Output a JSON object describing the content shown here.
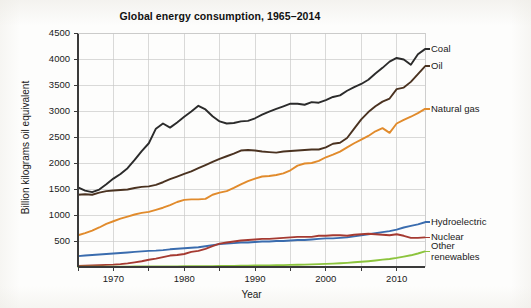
{
  "chart_data": {
    "type": "line",
    "title": "Global energy consumption, 1965–2014",
    "xlabel": "Year",
    "ylabel": "Billion kilograms oil equivalent",
    "xlim": [
      1965,
      2014
    ],
    "ylim": [
      0,
      4500
    ],
    "xticks": [
      1970,
      1980,
      1990,
      2000,
      2010
    ],
    "xticklabels": [
      "1970",
      "1980",
      "1990",
      "2000",
      "2010"
    ],
    "xminorticks": [
      1965,
      1975,
      1985,
      1995,
      2005
    ],
    "yticks": [
      500,
      1000,
      1500,
      2000,
      2500,
      3000,
      3500,
      4000,
      4500
    ],
    "yticklabels": [
      "500",
      "1000",
      "1500",
      "2000",
      "2500",
      "3000",
      "3500",
      "4000",
      "4500"
    ],
    "grid": true,
    "legend_position": "right-inline-labels",
    "x": [
      1965,
      1966,
      1967,
      1968,
      1969,
      1970,
      1971,
      1972,
      1973,
      1974,
      1975,
      1976,
      1977,
      1978,
      1979,
      1980,
      1981,
      1982,
      1983,
      1984,
      1985,
      1986,
      1987,
      1988,
      1989,
      1990,
      1991,
      1992,
      1993,
      1994,
      1995,
      1996,
      1997,
      1998,
      1999,
      2000,
      2001,
      2002,
      2003,
      2004,
      2005,
      2006,
      2007,
      2008,
      2009,
      2010,
      2011,
      2012,
      2013,
      2014
    ],
    "series": [
      {
        "name": "Coal",
        "color": "#2b2b2b",
        "values": [
          1530,
          1470,
          1440,
          1490,
          1590,
          1700,
          1790,
          1900,
          2060,
          2230,
          2380,
          2660,
          2760,
          2680,
          2780,
          2890,
          2990,
          3100,
          3030,
          2900,
          2800,
          2760,
          2770,
          2800,
          2810,
          2860,
          2930,
          2990,
          3040,
          3090,
          3140,
          3140,
          3120,
          3170,
          3160,
          3210,
          3270,
          3300,
          3390,
          3460,
          3520,
          3600,
          3720,
          3830,
          3950,
          4020,
          3990,
          3890,
          4090,
          4190
        ]
      },
      {
        "name": "Oil",
        "color": "#4a3220",
        "values": [
          1390,
          1400,
          1390,
          1430,
          1460,
          1470,
          1480,
          1490,
          1520,
          1540,
          1550,
          1580,
          1630,
          1690,
          1740,
          1790,
          1840,
          1900,
          1960,
          2020,
          2080,
          2130,
          2180,
          2240,
          2250,
          2240,
          2220,
          2210,
          2200,
          2220,
          2230,
          2240,
          2250,
          2260,
          2260,
          2300,
          2370,
          2390,
          2480,
          2660,
          2840,
          2980,
          3090,
          3180,
          3240,
          3420,
          3450,
          3560,
          3710,
          3860
        ]
      },
      {
        "name": "Natural gas",
        "color": "#e18b2c",
        "values": [
          610,
          650,
          700,
          760,
          830,
          880,
          930,
          970,
          1010,
          1040,
          1060,
          1100,
          1140,
          1190,
          1250,
          1290,
          1300,
          1300,
          1310,
          1390,
          1430,
          1460,
          1520,
          1590,
          1650,
          1700,
          1740,
          1750,
          1770,
          1800,
          1860,
          1950,
          1990,
          2000,
          2040,
          2110,
          2160,
          2220,
          2300,
          2380,
          2450,
          2520,
          2610,
          2670,
          2580,
          2760,
          2830,
          2890,
          2960,
          3040
        ]
      },
      {
        "name": "Hydroelectric",
        "color": "#3a6cae",
        "values": [
          210,
          220,
          230,
          240,
          250,
          260,
          270,
          280,
          290,
          300,
          310,
          315,
          325,
          340,
          350,
          360,
          370,
          380,
          400,
          420,
          440,
          450,
          460,
          470,
          470,
          480,
          490,
          490,
          500,
          500,
          510,
          520,
          520,
          530,
          540,
          550,
          550,
          560,
          570,
          590,
          610,
          630,
          650,
          670,
          690,
          720,
          760,
          790,
          820,
          860
        ]
      },
      {
        "name": "Nuclear",
        "color": "#a53a31",
        "values": [
          20,
          25,
          30,
          35,
          40,
          45,
          55,
          70,
          90,
          110,
          140,
          160,
          190,
          220,
          230,
          250,
          290,
          310,
          350,
          400,
          450,
          470,
          490,
          510,
          520,
          530,
          540,
          540,
          550,
          560,
          570,
          580,
          580,
          580,
          600,
          600,
          610,
          610,
          600,
          620,
          630,
          640,
          630,
          620,
          610,
          630,
          600,
          560,
          560,
          570
        ]
      },
      {
        "name": "Other renewables",
        "color": "#8cc43d",
        "values": [
          5,
          5,
          6,
          6,
          7,
          7,
          8,
          8,
          9,
          9,
          10,
          10,
          11,
          12,
          12,
          13,
          14,
          15,
          16,
          17,
          19,
          20,
          22,
          24,
          26,
          28,
          30,
          32,
          34,
          37,
          40,
          43,
          46,
          50,
          55,
          60,
          65,
          72,
          80,
          90,
          100,
          112,
          126,
          142,
          155,
          175,
          200,
          225,
          260,
          300
        ]
      }
    ],
    "series_labels": [
      {
        "name": "Coal",
        "label": "Coal"
      },
      {
        "name": "Oil",
        "label": "Oil"
      },
      {
        "name": "Natural gas",
        "label": "Natural gas"
      },
      {
        "name": "Hydroelectric",
        "label": "Hydroelectric"
      },
      {
        "name": "Nuclear",
        "label": "Nuclear"
      },
      {
        "name": "Other renewables",
        "label": "Other\nrenewables"
      }
    ]
  }
}
